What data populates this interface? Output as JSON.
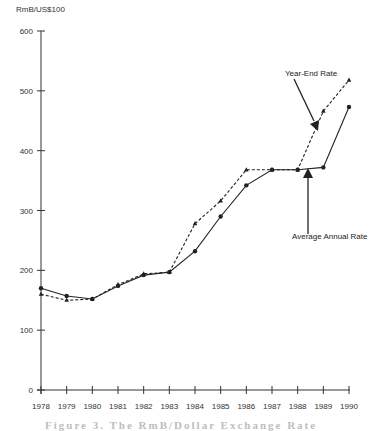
{
  "chart_data": {
    "type": "line",
    "title": "",
    "ylabel": "RmB/US$100",
    "xlabel": "",
    "ylim": [
      0,
      600
    ],
    "yticks": [
      0,
      100,
      200,
      300,
      400,
      500,
      600
    ],
    "categories": [
      "1978",
      "1979",
      "1980",
      "1981",
      "1982",
      "1983",
      "1984",
      "1985",
      "1986",
      "1987",
      "1988",
      "1989",
      "1990"
    ],
    "grid": false,
    "series": [
      {
        "name": "Average Annual Rate",
        "style": "solid",
        "marker": "circle",
        "values": [
          170,
          157,
          152,
          174,
          192,
          197,
          232,
          290,
          342,
          368,
          368,
          372,
          473
        ]
      },
      {
        "name": "Year-End Rate",
        "style": "dashed",
        "marker": "triangle",
        "values": [
          160,
          150,
          152,
          176,
          194,
          197,
          278,
          316,
          368,
          368,
          368,
          466,
          518
        ]
      }
    ],
    "annotations": [
      {
        "text": "Year-End Rate",
        "target_year": "1989"
      },
      {
        "text": "Average Annual Rate",
        "target_year": "1988"
      }
    ]
  },
  "labels": {
    "yaxis_title": "RmB/US$100",
    "ye_annotation": "Year-End Rate",
    "avg_annotation": "Average Annual Rate",
    "caption": "Figure 3. The RmB/Dollar Exchange Rate"
  }
}
